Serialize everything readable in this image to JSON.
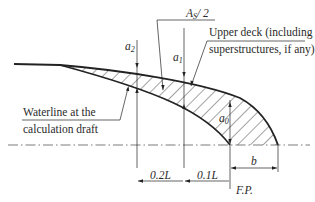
{
  "diagram": {
    "labels": {
      "area_label": "A",
      "area_label_sub": "S",
      "area_label_rest": "/ 2",
      "upper_deck_line1": "Upper deck (including",
      "upper_deck_line2": "superstructures, if any)",
      "waterline_line1": "Waterline at the",
      "waterline_line2": "calculation draft",
      "a2": "a",
      "a2_sub": "2",
      "a1": "a",
      "a1_sub": "1",
      "a0": "a",
      "a0_sub": "0",
      "dim_02L": "0.2L",
      "dim_01L": "0.1L",
      "dim_b": "b",
      "fp": "F.P."
    },
    "colors": {
      "line": "#222222",
      "background": "#ffffff"
    }
  }
}
